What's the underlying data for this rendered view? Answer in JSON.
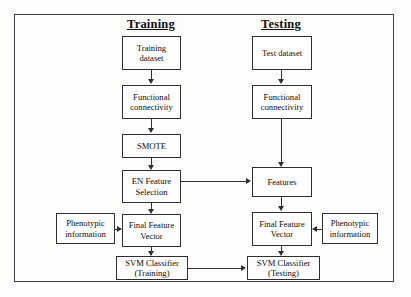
{
  "diagram": {
    "title_training": "Training",
    "title_testing": "Testing",
    "nodes": {
      "training_dataset": "Training\ndataset",
      "training_dataset_l1": "Training",
      "training_dataset_l2": "dataset",
      "train_functional_l1": "Functional",
      "train_functional_l2": "connectivity",
      "smote": "SMOTE",
      "en_feature_l1": "EN Feature",
      "en_feature_l2": "Selection",
      "train_final_vector_l1": "Final Feature",
      "train_final_vector_l2": "Vector",
      "train_phenotypic_l1": "Phenotypic",
      "train_phenotypic_l2": "information",
      "svm_training_l1": "SVM Classifier",
      "svm_training_l2": "(Training)",
      "test_dataset": "Test dataset",
      "test_functional_l1": "Functional",
      "test_functional_l2": "connectivity",
      "features": "Features",
      "test_final_vector_l1": "Final Feature",
      "test_final_vector_l2": "Vector",
      "test_phenotypic_l1": "Phenotypic",
      "test_phenotypic_l2": "information",
      "svm_testing_l1": "SVM Classifier",
      "svm_testing_l2": "(Testing)"
    },
    "colors": {
      "border": "#2e2e33",
      "frame": "#3d3d42",
      "text": "#0d0d0d",
      "background": "#fdfdfc"
    }
  }
}
